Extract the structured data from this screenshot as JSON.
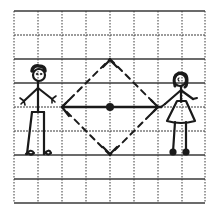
{
  "diagram": {
    "type": "hand-drawn grid illustration",
    "grid": {
      "columns": 8,
      "rows": 8,
      "left": 14,
      "top": 11,
      "cell_size": 24,
      "line_color": "#333333"
    },
    "center_point": {
      "x": 110,
      "y": 107
    },
    "diamond": {
      "style": "dashed",
      "vertices": {
        "top": {
          "x": 110,
          "y": 59
        },
        "right": {
          "x": 158,
          "y": 107
        },
        "bottom": {
          "x": 110,
          "y": 155
        },
        "left": {
          "x": 61,
          "y": 107
        }
      }
    },
    "horizontal_arrow": {
      "style": "solid",
      "from": {
        "x": 61,
        "y": 107
      },
      "to": {
        "x": 160,
        "y": 107
      },
      "arrowheads": [
        "left",
        "right"
      ]
    },
    "figures": [
      {
        "id": "boy",
        "position": "left",
        "x": 38
      },
      {
        "id": "girl",
        "position": "right",
        "x": 180
      }
    ],
    "ink_color": "#1a1a1a"
  }
}
